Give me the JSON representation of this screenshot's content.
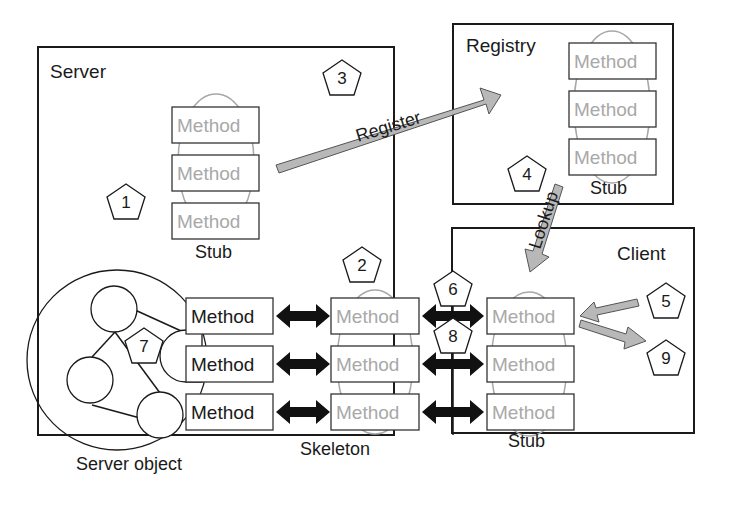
{
  "server": {
    "title": "Server",
    "stub_label": "Stub",
    "server_object_label": "Server object",
    "skeleton_label": "Skeleton"
  },
  "registry": {
    "title": "Registry",
    "stub_label": "Stub"
  },
  "client": {
    "title": "Client",
    "stub_label": "Stub"
  },
  "method_label": "Method",
  "arrows": {
    "register": "Register",
    "lookup": "Lookup"
  },
  "steps": [
    "1",
    "2",
    "3",
    "4",
    "5",
    "6",
    "7",
    "8",
    "9"
  ],
  "colors": {
    "outline": "#1a1a1a",
    "method_gray": "#a8a8a8",
    "arrow_gray": "#b8b8b8",
    "arrow_dark": "#111111"
  }
}
